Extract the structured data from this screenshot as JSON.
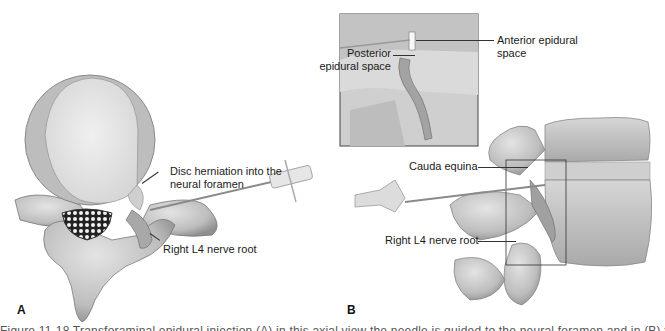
{
  "figure": {
    "panels": [
      {
        "id": "A",
        "letter": "A",
        "labels": {
          "disc_herniation_line1": "Disc herniation into the",
          "disc_herniation_line2": "neural foramen",
          "nerve_root": "Right L4 nerve root"
        }
      },
      {
        "id": "B",
        "letter": "B",
        "labels": {
          "posterior_line1": "Posterior",
          "posterior_line2": "epidural space",
          "anterior_line1": "Anterior epidural",
          "anterior_line2": "space",
          "cauda_equina": "Cauda equina",
          "nerve_root": "Right L4 nerve root"
        }
      }
    ],
    "caption_truncated": "Figure 11-18 Transforaminal epidural injection (A) in this axial view the needle is guided to the neural foramen and in (B) the lateral view shows the needle placement"
  },
  "colors": {
    "bone_light": "#d9d9d9",
    "bone_mid": "#b5b5b5",
    "bone_dark": "#8a8a8a",
    "disc_core": "#e8e8e8",
    "text": "#1a1a1a"
  }
}
